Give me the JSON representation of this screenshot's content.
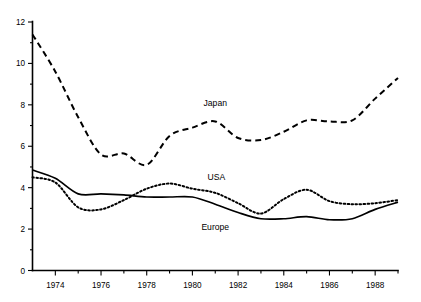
{
  "chart_data": {
    "type": "line",
    "title": "",
    "subtitle": "",
    "xlabel": "",
    "ylabel": "",
    "xlim": [
      1973,
      1989
    ],
    "ylim": [
      0,
      12
    ],
    "grid": false,
    "legend_position": "inline-annotations",
    "y_ticks": [
      0,
      2,
      4,
      6,
      8,
      10,
      12
    ],
    "y_tick_labels": [
      "0",
      "2",
      "4",
      "6",
      "8",
      "10",
      "12"
    ],
    "y_minor_ticks": [
      1,
      3,
      5,
      7,
      9,
      11
    ],
    "x_ticks": [
      1974,
      1976,
      1978,
      1980,
      1982,
      1984,
      1986,
      1988
    ],
    "x_tick_labels": [
      "1974",
      "1976",
      "1978",
      "1980",
      "1982",
      "1984",
      "1986",
      "1988"
    ],
    "x_minor_ticks": [
      1975,
      1977,
      1979,
      1981,
      1983,
      1985,
      1987,
      1989
    ],
    "x": [
      1973,
      1974,
      1975,
      1976,
      1977,
      1978,
      1979,
      1980,
      1981,
      1982,
      1983,
      1984,
      1985,
      1986,
      1987,
      1988,
      1989
    ],
    "series": [
      {
        "name": "Japan",
        "style": "dashed",
        "color": "#000000",
        "label_x": 1981.0,
        "label_y": 7.95,
        "values": [
          11.4,
          9.6,
          7.4,
          5.6,
          5.65,
          5.1,
          6.5,
          6.9,
          7.2,
          6.4,
          6.3,
          6.7,
          7.25,
          7.2,
          7.25,
          8.3,
          9.3
        ]
      },
      {
        "name": "USA",
        "style": "dotted",
        "color": "#000000",
        "label_x": 1981.05,
        "label_y": 4.35,
        "values": [
          4.5,
          4.25,
          3.05,
          2.95,
          3.4,
          3.95,
          4.2,
          3.95,
          3.75,
          3.25,
          2.75,
          3.45,
          3.9,
          3.35,
          3.2,
          3.25,
          3.4
        ]
      },
      {
        "name": "Europe",
        "style": "solid",
        "color": "#000000",
        "label_x": 1981.0,
        "label_y": 1.95,
        "values": [
          4.85,
          4.45,
          3.7,
          3.7,
          3.65,
          3.55,
          3.55,
          3.55,
          3.2,
          2.8,
          2.5,
          2.5,
          2.6,
          2.45,
          2.5,
          2.95,
          3.3
        ]
      }
    ]
  }
}
